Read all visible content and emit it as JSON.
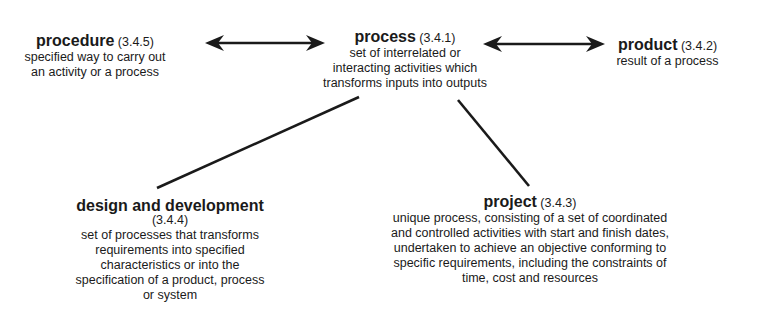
{
  "diagram": {
    "nodes": {
      "procedure": {
        "term": "procedure",
        "ref": "(3.4.5)",
        "definition": [
          "specified way to carry out",
          "an activity or a process"
        ]
      },
      "process": {
        "term": "process",
        "ref": "(3.4.1)",
        "definition": [
          "set of interrelated or",
          "interacting activities which",
          "transforms inputs into outputs"
        ]
      },
      "product": {
        "term": "product",
        "ref": "(3.4.2)",
        "definition": [
          "result of a process"
        ]
      },
      "design_and_development": {
        "term": "design and development",
        "ref": "(3.4.4)",
        "definition": [
          "set of processes that transforms",
          "requirements into specified",
          "characteristics  or into the",
          "specification of a product, process",
          "or system"
        ]
      },
      "project": {
        "term": "project",
        "ref": "(3.4.3)",
        "definition": [
          "unique process, consisting of a set of coordinated",
          "and controlled activities with start and finish dates,",
          "undertaken to achieve an objective conforming to",
          "specific requirements, including the constraints of",
          "time, cost and resources"
        ]
      }
    },
    "edges": [
      {
        "from": "procedure",
        "to": "process",
        "type": "double-arrow"
      },
      {
        "from": "process",
        "to": "product",
        "type": "double-arrow"
      },
      {
        "from": "process",
        "to": "design_and_development",
        "type": "line"
      },
      {
        "from": "process",
        "to": "project",
        "type": "line"
      }
    ],
    "colors": {
      "ink": "#1a1a1a",
      "background": "#ffffff"
    }
  }
}
